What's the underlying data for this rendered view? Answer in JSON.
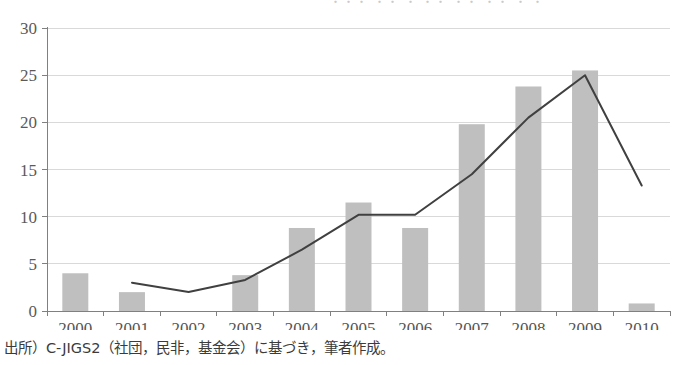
{
  "caption": {
    "source_note": "出所）C-JIGS2（社団，民非，基金会）に基づき，筆者作成。"
  },
  "top_sliver": {
    "text": "・・・ ・・ ・ ・・ ・・ ・・ ・ ・"
  },
  "colors": {
    "bar_fill": "#bfbfbf",
    "line_stroke": "#404040",
    "grid": "#d9d9d9",
    "axis": "#808080",
    "tick_text": "#555555",
    "background": "#ffffff"
  },
  "chart_data": {
    "type": "bar",
    "title": "",
    "subtitle": "",
    "xlabel": "",
    "ylabel": "",
    "categories": [
      "2000",
      "2001",
      "2002",
      "2003",
      "2004",
      "2005",
      "2006",
      "2007",
      "2008",
      "2009",
      "2010"
    ],
    "ylim": [
      0,
      30
    ],
    "yticks": [
      0,
      5,
      10,
      15,
      20,
      25,
      30
    ],
    "ytick_labels": [
      "0",
      "5",
      "10",
      "15",
      "20",
      "25",
      "30"
    ],
    "grid": "horizontal",
    "legend": "none",
    "series": [
      {
        "name": "bars",
        "type": "bar",
        "color": "#bfbfbf",
        "values": [
          4.0,
          2.0,
          0,
          3.8,
          8.8,
          11.5,
          8.8,
          19.8,
          23.8,
          25.5,
          0.8
        ]
      },
      {
        "name": "line",
        "type": "line",
        "color": "#404040",
        "values": [
          null,
          3.0,
          2.0,
          3.3,
          6.5,
          10.2,
          10.2,
          14.5,
          20.5,
          25.0,
          13.3
        ]
      }
    ]
  }
}
